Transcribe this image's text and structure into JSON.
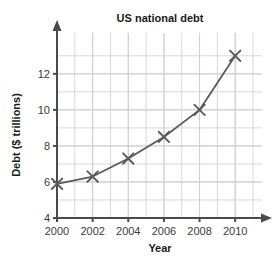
{
  "chart_data": {
    "type": "line",
    "title": "US national debt",
    "xlabel": "Year",
    "ylabel": "Debt ($ trillions)",
    "x": [
      2000,
      2002,
      2004,
      2006,
      2008,
      2010
    ],
    "values": [
      5.9,
      6.3,
      7.3,
      8.5,
      10.0,
      13.0
    ],
    "xlim": [
      2000,
      2011
    ],
    "ylim": [
      4,
      13.6
    ],
    "xticks": [
      2000,
      2002,
      2004,
      2006,
      2008,
      2010
    ],
    "xtick_labels": [
      "2000",
      "2002",
      "2004",
      "2006",
      "2008",
      "2010"
    ],
    "yticks": [
      4,
      6,
      8,
      10,
      12
    ],
    "ytick_labels": [
      "4",
      "6",
      "8",
      "10",
      "12"
    ],
    "y_minor_step": 1,
    "x_minor_step": 1,
    "grid": true,
    "legend": "none",
    "marker": "x",
    "series_color": "#5a5a5a",
    "grid_color": "#d8d8d8",
    "axis_color": "#4a4a4a",
    "series": [
      {
        "name": "US national debt",
        "points": [
          {
            "x": 2000,
            "y": 5.9
          },
          {
            "x": 2002,
            "y": 6.3
          },
          {
            "x": 2004,
            "y": 7.3
          },
          {
            "x": 2006,
            "y": 8.5
          },
          {
            "x": 2008,
            "y": 10.0
          },
          {
            "x": 2010,
            "y": 13.0
          }
        ]
      }
    ]
  },
  "axes": {
    "y_arrow": "up-arrow-icon",
    "x_arrow": "right-arrow-icon"
  }
}
